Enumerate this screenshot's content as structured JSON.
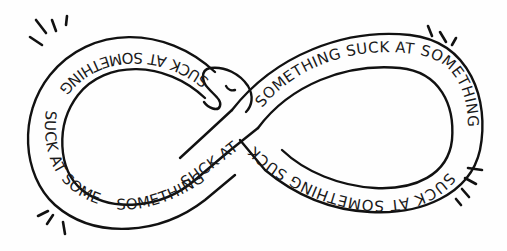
{
  "illustration": {
    "subject": "infinity-snake",
    "band_phrase": "SUCK AT SOMETHING",
    "segments": [
      {
        "id": "left-top",
        "text": "SUCK AT SOMETHING",
        "orientation": "upside-down"
      },
      {
        "id": "left-outer",
        "text": "SUCK AT SOMETHING",
        "orientation": "normal"
      },
      {
        "id": "left-bottom",
        "text": "SUCK AT",
        "orientation": "normal"
      },
      {
        "id": "right-top",
        "text": "SOMETHING SUCK AT SOMETHING",
        "orientation": "normal"
      },
      {
        "id": "right-bottom",
        "text": "SUCK AT SOMETHING SUCK",
        "orientation": "upside-down"
      }
    ],
    "colors": {
      "line": "#111111",
      "text": "#1a1a1a",
      "background": "#fefefe"
    },
    "emphasis_marks": [
      "top-left",
      "top-right",
      "bottom-left",
      "bottom-right"
    ]
  }
}
